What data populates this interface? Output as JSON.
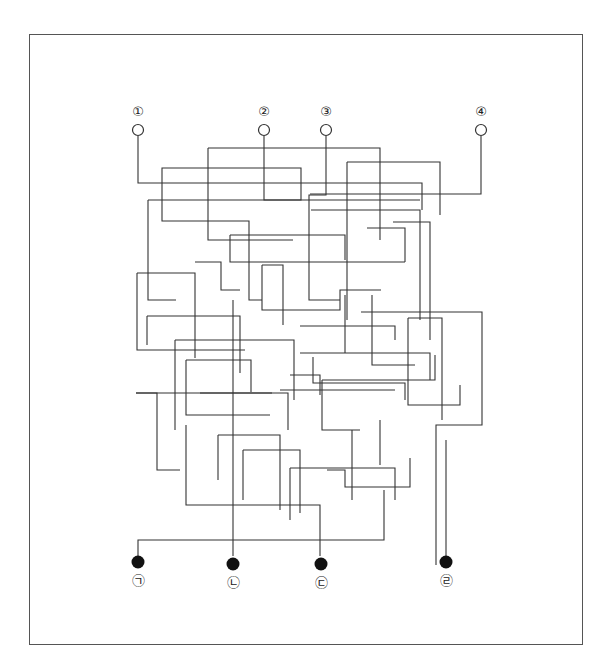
{
  "diagram": {
    "type": "line-tracing maze puzzle",
    "frame": {
      "x": 29,
      "y": 34,
      "width": 554,
      "height": 611,
      "border_color": "#555555"
    },
    "line_color": "#333333",
    "start_nodes": [
      {
        "id": "1",
        "label": "①",
        "x": 138,
        "y": 130,
        "style": "hollow"
      },
      {
        "id": "2",
        "label": "②",
        "x": 264,
        "y": 130,
        "style": "hollow"
      },
      {
        "id": "3",
        "label": "③",
        "x": 326,
        "y": 130,
        "style": "hollow"
      },
      {
        "id": "4",
        "label": "④",
        "x": 481,
        "y": 130,
        "style": "hollow"
      }
    ],
    "end_nodes": [
      {
        "id": "ㄱ",
        "label": "㉠",
        "x": 138,
        "y": 562,
        "style": "filled"
      },
      {
        "id": "ㄴ",
        "label": "㉡",
        "x": 233,
        "y": 564,
        "style": "filled"
      },
      {
        "id": "ㄷ",
        "label": "㉢",
        "x": 321,
        "y": 564,
        "style": "filled"
      },
      {
        "id": "ㄹ",
        "label": "㉣",
        "x": 446,
        "y": 562,
        "style": "filled"
      }
    ],
    "segments": [
      [
        138,
        136,
        138,
        183,
        422,
        183,
        422,
        210
      ],
      [
        264,
        136,
        264,
        200,
        301,
        200,
        301,
        168,
        162,
        168,
        162,
        221,
        249,
        221,
        249,
        300,
        262,
        300
      ],
      [
        326,
        136,
        326,
        195,
        309,
        195,
        309,
        300,
        340,
        300
      ],
      [
        481,
        136,
        481,
        194,
        310,
        194
      ],
      [
        208,
        148,
        380,
        148,
        380,
        240
      ],
      [
        208,
        148,
        208,
        240,
        293,
        240
      ],
      [
        347,
        162,
        440,
        162,
        440,
        215
      ],
      [
        347,
        162,
        347,
        320
      ],
      [
        148,
        200,
        148,
        300,
        176,
        300
      ],
      [
        148,
        200,
        420,
        200
      ],
      [
        311,
        210,
        420,
        210,
        420,
        320
      ],
      [
        230,
        235,
        345,
        235,
        345,
        260
      ],
      [
        230,
        235,
        230,
        262,
        405,
        262
      ],
      [
        367,
        228,
        405,
        228,
        405,
        262
      ],
      [
        393,
        222,
        430,
        222,
        430,
        340
      ],
      [
        235,
        260,
        235,
        260
      ],
      [
        137,
        273,
        137,
        350,
        245,
        350
      ],
      [
        137,
        273,
        195,
        273,
        195,
        358
      ],
      [
        195,
        262,
        221,
        262,
        221,
        290,
        240,
        290
      ],
      [
        262,
        265,
        262,
        310,
        340,
        310,
        340,
        290,
        381,
        290
      ],
      [
        262,
        265,
        283,
        265,
        283,
        325
      ],
      [
        300,
        326,
        395,
        326,
        395,
        340
      ],
      [
        372,
        295,
        372,
        365,
        415,
        365
      ],
      [
        345,
        295,
        345,
        353
      ],
      [
        147,
        316,
        240,
        316,
        240,
        373
      ],
      [
        147,
        316,
        147,
        345
      ],
      [
        175,
        340,
        294,
        340,
        294,
        400
      ],
      [
        175,
        340,
        175,
        430
      ],
      [
        300,
        353,
        430,
        353,
        430,
        380
      ],
      [
        313,
        357,
        313,
        383,
        405,
        383,
        405,
        400
      ],
      [
        186,
        360,
        186,
        415,
        270,
        415
      ],
      [
        186,
        360,
        251,
        360,
        251,
        392
      ],
      [
        200,
        393,
        288,
        393,
        288,
        430
      ],
      [
        290,
        375,
        320,
        375,
        320,
        395
      ],
      [
        322,
        380,
        435,
        380,
        435,
        355
      ],
      [
        322,
        380,
        322,
        430,
        360,
        430
      ],
      [
        361,
        312,
        482,
        312,
        482,
        425,
        436,
        425,
        436,
        565
      ],
      [
        408,
        318,
        408,
        405,
        460,
        405,
        460,
        385
      ],
      [
        408,
        318,
        442,
        318,
        442,
        420
      ],
      [
        136,
        393,
        157,
        393,
        157,
        470,
        180,
        470
      ],
      [
        136,
        393,
        272,
        393
      ],
      [
        186,
        425,
        186,
        505,
        320,
        505,
        320,
        556
      ],
      [
        218,
        435,
        218,
        480
      ],
      [
        218,
        435,
        280,
        435,
        280,
        510
      ],
      [
        280,
        390,
        395,
        390
      ],
      [
        243,
        450,
        300,
        450,
        300,
        513
      ],
      [
        243,
        450,
        243,
        500
      ],
      [
        290,
        468,
        395,
        468,
        395,
        500
      ],
      [
        290,
        468,
        290,
        520
      ],
      [
        327,
        470,
        345,
        470,
        345,
        487,
        410,
        487,
        410,
        458
      ],
      [
        352,
        430,
        352,
        500
      ],
      [
        380,
        420,
        380,
        465
      ],
      [
        138,
        556,
        138,
        540,
        384,
        540,
        384,
        490
      ],
      [
        233,
        556,
        233,
        300
      ],
      [
        446,
        556,
        446,
        440
      ]
    ]
  }
}
